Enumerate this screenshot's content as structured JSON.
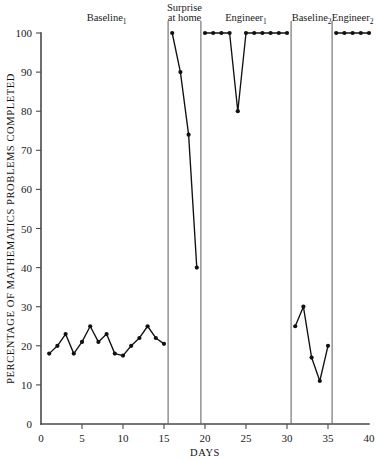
{
  "chart_data": {
    "type": "line",
    "title": "",
    "xlabel": "DAYS",
    "ylabel": "PERCENTAGE OF MATHEMATICS PROBLEMS COMPLETED",
    "xlim": [
      0,
      40
    ],
    "ylim": [
      0,
      100
    ],
    "xticks": [
      0,
      5,
      10,
      15,
      20,
      25,
      30,
      35,
      40
    ],
    "xtick_labels": [
      "0",
      "5",
      "10",
      "15",
      "20",
      "25",
      "30",
      "35",
      "40"
    ],
    "yticks": [
      0,
      10,
      20,
      30,
      40,
      50,
      60,
      70,
      80,
      90,
      100
    ],
    "ytick_labels": [
      "0",
      "10",
      "20",
      "30",
      "40",
      "50",
      "60",
      "70",
      "80",
      "90",
      "100"
    ],
    "grid": false,
    "legend": "none",
    "marker": "filled-circle",
    "line_color": "#111111",
    "phase_dividers": [
      15.5,
      19.5,
      30.5,
      35.5
    ],
    "phases": [
      {
        "name": "baseline-1",
        "label": "Baseline",
        "label_sub": "1",
        "label_x": 8.0,
        "x": [
          1,
          2,
          3,
          4,
          5,
          6,
          7,
          8,
          9,
          10,
          11,
          12,
          13,
          14,
          15
        ],
        "y": [
          18,
          20,
          23,
          18,
          21,
          25,
          21,
          23,
          18,
          17.5,
          20,
          22,
          25,
          22,
          20.5
        ]
      },
      {
        "name": "surprise-at-home",
        "label": "Surprise",
        "label_line2": "at home",
        "label_x": 17.5,
        "x": [
          16,
          17,
          18,
          19
        ],
        "y": [
          100,
          90,
          74,
          40
        ]
      },
      {
        "name": "engineer-1",
        "label": "Engineer",
        "label_sub": "1",
        "label_x": 25.0,
        "x": [
          20,
          21,
          22,
          23,
          24,
          25,
          26,
          27,
          28,
          29,
          30
        ],
        "y": [
          100,
          100,
          100,
          100,
          80,
          100,
          100,
          100,
          100,
          100,
          100
        ]
      },
      {
        "name": "baseline-2",
        "label": "Baseline",
        "label_sub": "2",
        "label_x": 33.0,
        "x": [
          31,
          32,
          33,
          34,
          35
        ],
        "y": [
          25,
          30,
          17,
          11,
          20
        ]
      },
      {
        "name": "engineer-2",
        "label": "Engineer",
        "label_sub": "2",
        "label_x": 38.0,
        "x": [
          36,
          37,
          38,
          39,
          40
        ],
        "y": [
          100,
          100,
          100,
          100,
          100
        ]
      }
    ]
  }
}
